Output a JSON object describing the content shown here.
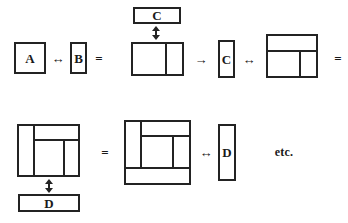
{
  "figure": {
    "kind": "rectangle-composition-diagram",
    "background_color": "#ffffff",
    "stroke_color": "#232323",
    "text_color": "#1a1a1a",
    "width": 348,
    "height": 223
  },
  "labels": {
    "a": "A",
    "b": "B",
    "c_top": "C",
    "c_mid": "C",
    "d_bottom": "D",
    "d_right": "D",
    "etc": "etc."
  },
  "operators": {
    "swap_ab": "↔",
    "equals_1": "=",
    "implies": "→",
    "swap_c": "↔",
    "equals_2": "=",
    "equals_3": "=",
    "swap_d": "↔",
    "vertical_join_c": "↕",
    "vertical_join_d": "↕"
  },
  "rows": [
    {
      "name": "row-1",
      "expression": "A ↔ B  =  [AB] ↕ C  →  C ↔ [C over AB]  =",
      "items": [
        {
          "name": "box-a",
          "label": "A",
          "shape": "square"
        },
        {
          "name": "op-swap-ab",
          "label": "↔"
        },
        {
          "name": "box-b",
          "label": "B",
          "shape": "tall-narrow"
        },
        {
          "name": "op-equals-1",
          "label": "="
        },
        {
          "name": "box-c-top",
          "label": "C",
          "shape": "wide-flat"
        },
        {
          "name": "op-vjoin-c",
          "label": "↕"
        },
        {
          "name": "composite-ab",
          "label": "",
          "shape": "split-vertical"
        },
        {
          "name": "op-implies",
          "label": "→"
        },
        {
          "name": "box-c-mid",
          "label": "C",
          "shape": "tall-narrow"
        },
        {
          "name": "op-swap-c",
          "label": "↔"
        },
        {
          "name": "composite-cab",
          "label": "",
          "shape": "band-top-split-bottom"
        },
        {
          "name": "op-equals-2",
          "label": "="
        }
      ]
    },
    {
      "name": "row-2",
      "expression": "[C | AB] ↕ D  =  [ [C|AB] over D ] ↔ D   etc.",
      "items": [
        {
          "name": "composite-rotated",
          "label": "",
          "shape": "band-left-split-right"
        },
        {
          "name": "op-vjoin-d",
          "label": "↕"
        },
        {
          "name": "box-d-bottom",
          "label": "D",
          "shape": "wide-flat"
        },
        {
          "name": "op-equals-3",
          "label": "="
        },
        {
          "name": "composite-full",
          "label": "",
          "shape": "nested-with-bottom-band"
        },
        {
          "name": "op-swap-d",
          "label": "↔"
        },
        {
          "name": "box-d-right",
          "label": "D",
          "shape": "tall-narrow"
        },
        {
          "name": "text-etc",
          "label": "etc."
        }
      ]
    }
  ]
}
